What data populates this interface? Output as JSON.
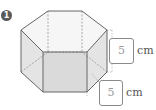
{
  "problem": {
    "number": "1",
    "figure": "hexagonal-prism",
    "labels": [
      {
        "value": "5",
        "unit": "cm",
        "describes": "prism height"
      },
      {
        "value": "5",
        "unit": "cm",
        "describes": "base edge length"
      }
    ]
  },
  "colors": {
    "edge": "#666666",
    "top_face": "#f6f6f6",
    "side_face": "#e4e4e4",
    "front_face": "#dadada",
    "badge": "#5a5a5a",
    "box_border": "#8a8a8a",
    "box_value": "#9a9a9a",
    "unit_text": "#555555"
  }
}
